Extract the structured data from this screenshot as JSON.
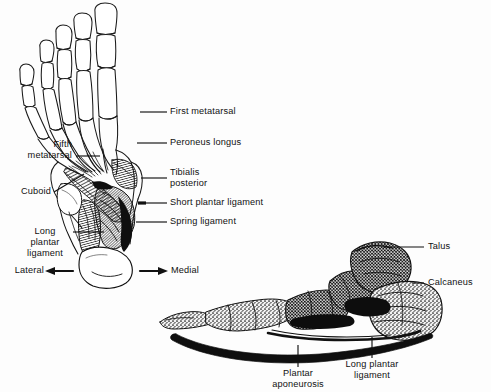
{
  "figure": {
    "background_color": "#fdfdfd",
    "ink_color": "#111111",
    "width": 491,
    "height": 392
  },
  "plantar_view": {
    "name": "Plantar (inferior) view of the foot",
    "labels": {
      "first_metatarsal": "First metatarsal",
      "peroneus_longus": "Peroneus longus",
      "tibialis_posterior_line1": "Tibialis",
      "tibialis_posterior_line2": "posterior",
      "short_plantar_ligament": "Short plantar ligament",
      "spring_ligament": "Spring ligament",
      "fifth_metatarsal_line1": "Fifth",
      "fifth_metatarsal_line2": "metatarsal",
      "cuboid": "Cuboid",
      "long_plantar_ligament_line1": "Long",
      "long_plantar_ligament_line2": "plantar",
      "long_plantar_ligament_line3": "ligament",
      "lateral": "Lateral",
      "medial": "Medial"
    }
  },
  "lateral_view": {
    "name": "Lateral (side) view of the foot arch",
    "labels": {
      "talus": "Talus",
      "calcaneus": "Calcaneus",
      "plantar_aponeurosis_line1": "Plantar",
      "plantar_aponeurosis_line2": "aponeurosis",
      "long_plantar_ligament_line1": "Long plantar",
      "long_plantar_ligament_line2": "ligament"
    }
  }
}
